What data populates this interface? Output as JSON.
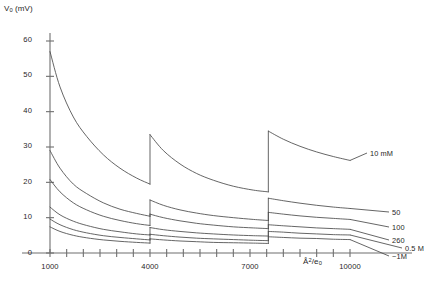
{
  "figure": {
    "background": "#ffffff",
    "curve_color": "#4a4a4a",
    "axis_color": "#6f6f6f"
  },
  "axes": {
    "y_title_main": "V",
    "y_title_sub": "0",
    "y_title_unit": " (mV)",
    "y_title_full": "V0 (mV)",
    "x_unit_main": "Å",
    "x_unit_sup": "2",
    "x_unit_div": "/e",
    "x_unit_sub": "0",
    "x_unit_full": "Å2/e0",
    "y_ticks": [
      "0",
      "10",
      "20",
      "30",
      "40",
      "50",
      "60"
    ],
    "x_ticks": [
      "1000",
      "4000",
      "7000",
      "10000"
    ]
  },
  "series_labels": {
    "s1": "10 mM",
    "s2": "50",
    "s3": "100",
    "s4": "260",
    "s5": "0.5 M",
    "s6": "~1M"
  },
  "chart_data": {
    "type": "line",
    "title": "",
    "xlabel": "Å2/e0",
    "ylabel": "V0 (mV)",
    "xlim": [
      1000,
      10000
    ],
    "ylim": [
      0,
      60
    ],
    "grid": false,
    "legend_position": "right-inline-labels",
    "x_ticks": [
      1000,
      4000,
      7000,
      10000
    ],
    "y_ticks": [
      0,
      10,
      20,
      30,
      40,
      50,
      60
    ],
    "discontinuities_x": [
      4000,
      7550
    ],
    "series": [
      {
        "name": "10 mM",
        "label": "10 mM",
        "segments": [
          {
            "x": [
              1000,
              1300,
              1700,
              2100,
              2600,
              3100,
              3600,
              4000
            ],
            "y": [
              57.0,
              47.0,
              38.5,
              33.0,
              27.8,
              24.0,
              21.2,
              19.5
            ]
          },
          {
            "x": [
              4000,
              4400,
              4900,
              5400,
              5900,
              6500,
              7100,
              7550
            ],
            "y": [
              33.5,
              29.0,
              25.2,
              22.5,
              20.6,
              18.9,
              17.8,
              17.3
            ]
          },
          {
            "x": [
              7550,
              8000,
              8500,
              9000,
              9500,
              10000
            ],
            "y": [
              34.5,
              32.2,
              30.2,
              28.6,
              27.3,
              26.2
            ]
          }
        ]
      },
      {
        "name": "50",
        "label": "50",
        "segments": [
          {
            "x": [
              1000,
              1300,
              1700,
              2100,
              2600,
              3100,
              3600,
              4000
            ],
            "y": [
              29.0,
              24.0,
              19.5,
              16.8,
              14.2,
              12.4,
              11.2,
              10.4
            ]
          },
          {
            "x": [
              4000,
              4400,
              4900,
              5400,
              5900,
              6500,
              7100,
              7550
            ],
            "y": [
              15.0,
              13.5,
              12.2,
              11.3,
              10.6,
              10.0,
              9.5,
              9.2
            ]
          },
          {
            "x": [
              7550,
              8000,
              8500,
              9000,
              9500,
              10000
            ],
            "y": [
              15.5,
              14.8,
              14.1,
              13.5,
              13.0,
              12.6
            ]
          }
        ]
      },
      {
        "name": "100",
        "label": "100",
        "segments": [
          {
            "x": [
              1000,
              1300,
              1700,
              2100,
              2600,
              3100,
              3600,
              4000
            ],
            "y": [
              20.8,
              17.3,
              14.2,
              12.2,
              10.4,
              9.2,
              8.3,
              7.8
            ]
          },
          {
            "x": [
              4000,
              4400,
              4900,
              5400,
              5900,
              6500,
              7100,
              7550
            ],
            "y": [
              11.0,
              10.0,
              9.1,
              8.4,
              7.9,
              7.4,
              7.1,
              6.9
            ]
          },
          {
            "x": [
              7550,
              8000,
              8500,
              9000,
              9500,
              10000
            ],
            "y": [
              11.5,
              11.0,
              10.5,
              10.1,
              9.8,
              9.5
            ]
          }
        ]
      },
      {
        "name": "260",
        "label": "260",
        "segments": [
          {
            "x": [
              1000,
              1300,
              1700,
              2100,
              2600,
              3100,
              3600,
              4000
            ],
            "y": [
              13.0,
              10.8,
              9.0,
              7.8,
              6.7,
              6.0,
              5.4,
              5.1
            ]
          },
          {
            "x": [
              4000,
              4400,
              4900,
              5400,
              5900,
              6500,
              7100,
              7550
            ],
            "y": [
              7.2,
              6.6,
              6.1,
              5.7,
              5.4,
              5.1,
              4.9,
              4.8
            ]
          },
          {
            "x": [
              7550,
              8000,
              8500,
              9000,
              9500,
              10000
            ],
            "y": [
              8.0,
              7.7,
              7.4,
              7.1,
              6.9,
              6.7
            ]
          }
        ]
      },
      {
        "name": "0.5 M",
        "label": "0.5 M",
        "segments": [
          {
            "x": [
              1000,
              1300,
              1700,
              2100,
              2600,
              3100,
              3600,
              4000
            ],
            "y": [
              9.6,
              8.0,
              6.6,
              5.7,
              4.9,
              4.4,
              4.0,
              3.7
            ]
          },
          {
            "x": [
              4000,
              4400,
              4900,
              5400,
              5900,
              6500,
              7100,
              7550
            ],
            "y": [
              5.3,
              4.9,
              4.5,
              4.2,
              4.0,
              3.8,
              3.6,
              3.5
            ]
          },
          {
            "x": [
              7550,
              8000,
              8500,
              9000,
              9500,
              10000
            ],
            "y": [
              6.1,
              5.9,
              5.6,
              5.4,
              5.2,
              5.1
            ]
          }
        ]
      },
      {
        "name": "~1M",
        "label": "~1M",
        "segments": [
          {
            "x": [
              1000,
              1300,
              1700,
              2100,
              2600,
              3100,
              3600,
              4000
            ],
            "y": [
              7.4,
              6.1,
              5.0,
              4.3,
              3.7,
              3.3,
              3.0,
              2.8
            ]
          },
          {
            "x": [
              4000,
              4400,
              4900,
              5400,
              5900,
              6500,
              7100,
              7550
            ],
            "y": [
              4.0,
              3.7,
              3.4,
              3.2,
              3.0,
              2.9,
              2.8,
              2.7
            ]
          },
          {
            "x": [
              7550,
              8000,
              8500,
              9000,
              9500,
              10000
            ],
            "y": [
              4.6,
              4.4,
              4.2,
              4.1,
              3.9,
              3.8
            ]
          }
        ]
      }
    ]
  }
}
